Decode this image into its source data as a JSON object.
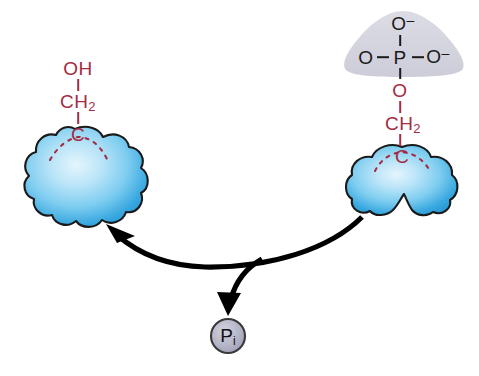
{
  "figure": {
    "background_color": "#ffffff"
  },
  "colors": {
    "chem_red": "#a32b42",
    "chem_dark": "#1a1a1a",
    "protein_blue_light": "#cceaf9",
    "protein_blue_mid": "#7fcdf0",
    "protein_blue_deep": "#1f93d4",
    "protein_outline": "#1a1a1a",
    "phosphate_gray": "#d3d3dd",
    "pi_fill": "#b2b2c6",
    "pi_stroke": "#3a3a3a",
    "arrow_black": "#000000"
  },
  "left_molecule": {
    "name": "dephosphorylated-protein",
    "hydroxyl_label": "OH",
    "methylene_label": "CH",
    "methylene_sub": "2",
    "carbon_label": "C"
  },
  "right_molecule": {
    "name": "phosphorylated-protein",
    "phosphate": {
      "top_oxygen": "O",
      "top_charge": "–",
      "left_oxygen": "O",
      "phosphorus": "P",
      "right_oxygen": "O",
      "right_charge": "–"
    },
    "ester_oxygen": "O",
    "methylene_label": "CH",
    "methylene_sub": "2",
    "carbon_label": "C"
  },
  "product": {
    "name": "inorganic-phosphate",
    "label": "P",
    "subscript": "i"
  },
  "arrows": {
    "main_reaction": "curved arrow from phosphorylated protein to dephosphorylated protein",
    "release_branch": "curved arrow releasing inorganic phosphate"
  }
}
